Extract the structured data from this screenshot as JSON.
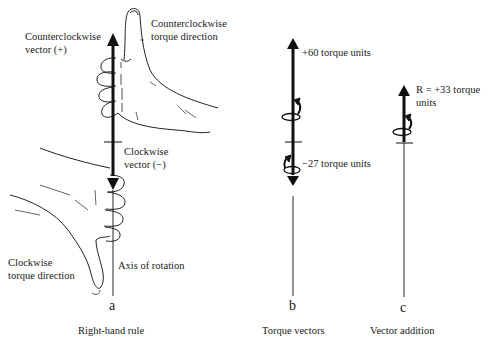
{
  "figure": {
    "panels": [
      {
        "id": "a",
        "letter": "a",
        "caption": "Right-hand rule",
        "labels": {
          "ccw_vector_line1": "Counterclockwise",
          "ccw_vector_line2": "vector (+)",
          "ccw_torque_line1": "Counterclockwise",
          "ccw_torque_line2": "torque direction",
          "cw_vector_line1": "Clockwise",
          "cw_vector_line2": "vector (−)",
          "cw_torque_line1": "Clockwise",
          "cw_torque_line2": "torque direction",
          "axis": "Axis of rotation"
        }
      },
      {
        "id": "b",
        "letter": "b",
        "caption": "Torque vectors",
        "labels": {
          "positive": "+60 torque units",
          "negative": "−27 torque units"
        }
      },
      {
        "id": "c",
        "letter": "c",
        "caption": "Vector addition",
        "labels": {
          "result_line1": "R = +33 torque",
          "result_line2": "units"
        }
      }
    ],
    "values": {
      "positive_torque": 60,
      "negative_torque": -27,
      "resultant_torque": 33
    }
  }
}
